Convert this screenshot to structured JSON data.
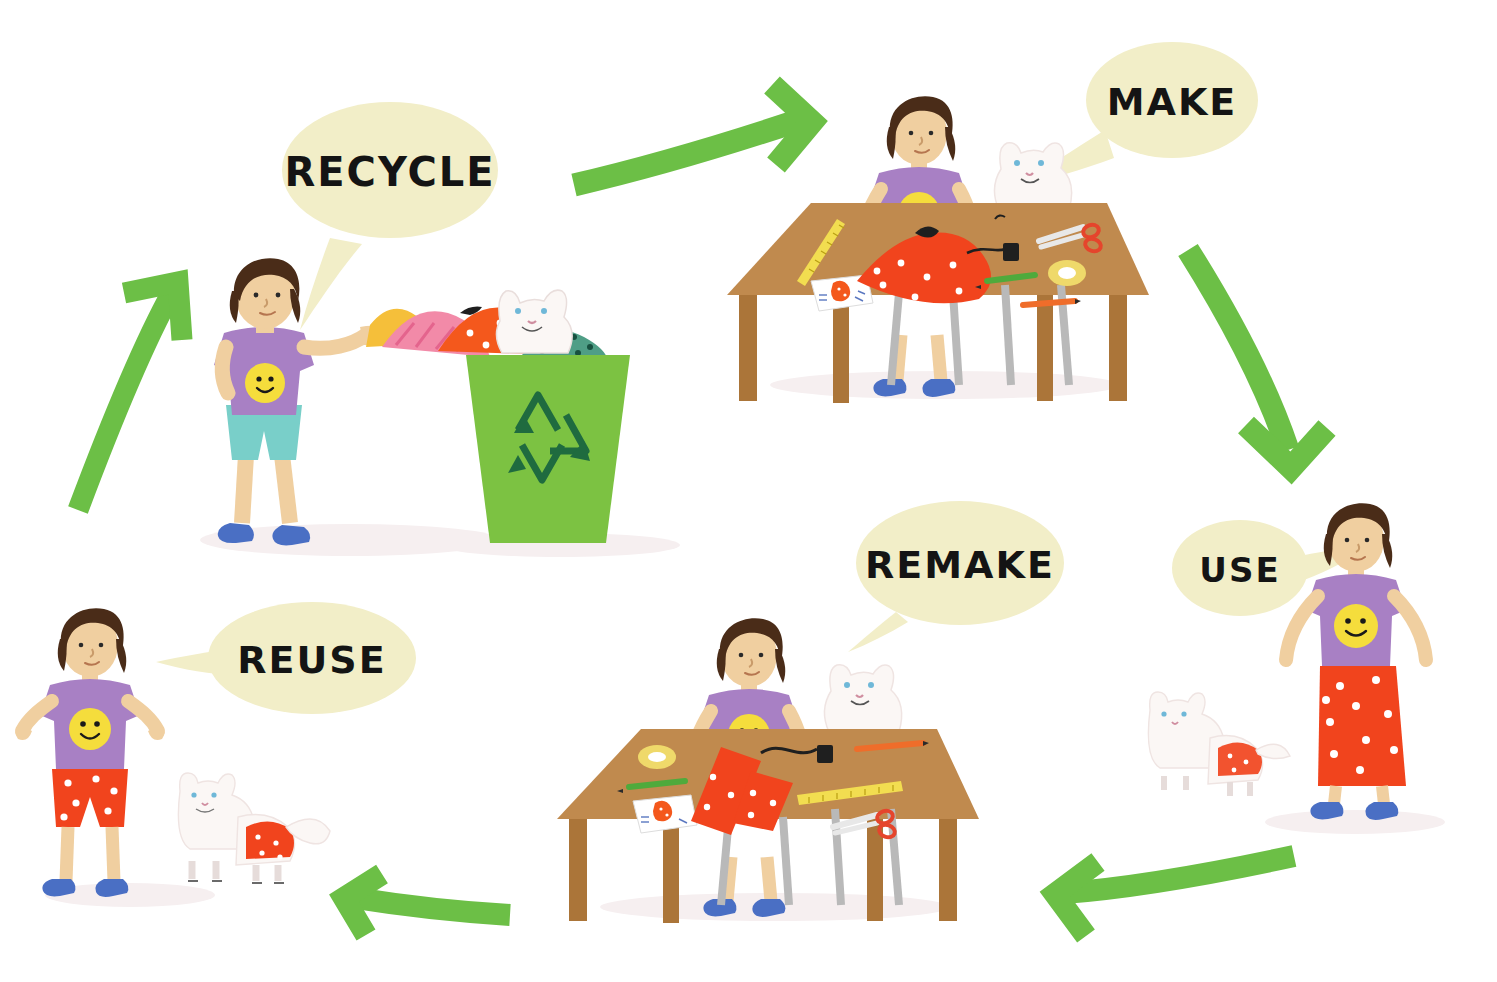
{
  "diagram": {
    "type": "cycle",
    "background_color": "#ffffff",
    "step_order": [
      "MAKE",
      "USE",
      "REMAKE",
      "REUSE",
      "RECYCLE"
    ],
    "steps": [
      {
        "id": "recycle",
        "label": "RECYCLE",
        "bubble": {
          "cx": 390,
          "cy": 170,
          "rx": 108,
          "ry": 68,
          "fill": "#f2eec8",
          "tail": "down-left",
          "font_size": 40
        },
        "scene": "Girl placing folded clothes into a green recycling bin with a white cat peeking over the top",
        "scene_box": {
          "x": 170,
          "y": 255,
          "w": 460,
          "h": 300
        }
      },
      {
        "id": "make",
        "label": "MAKE",
        "bubble": {
          "cx": 1172,
          "cy": 100,
          "rx": 86,
          "ry": 58,
          "fill": "#f2eec8",
          "tail": "down-left",
          "font_size": 38
        },
        "scene": "Girl at a wooden craft table sewing a red polka-dot skirt, white cat beside her",
        "scene_box": {
          "x": 715,
          "y": 85,
          "w": 430,
          "h": 310
        }
      },
      {
        "id": "use",
        "label": "USE",
        "bubble": {
          "cx": 1240,
          "cy": 568,
          "rx": 68,
          "ry": 48,
          "fill": "#f2eec8",
          "tail": "right",
          "font_size": 34
        },
        "scene": "Girl standing wearing the finished long red polka-dot skirt, white cat nearby",
        "scene_box": {
          "x": 1130,
          "y": 505,
          "w": 350,
          "h": 330
        }
      },
      {
        "id": "remake",
        "label": "REMAKE",
        "bubble": {
          "cx": 960,
          "cy": 563,
          "rx": 104,
          "ry": 62,
          "fill": "#f2eec8",
          "tail": "down-left",
          "font_size": 38
        },
        "scene": "Girl at the wooden table cutting the red polka-dot fabric into smaller pieces, white cat watching",
        "scene_box": {
          "x": 545,
          "y": 595,
          "w": 430,
          "h": 330
        }
      },
      {
        "id": "reuse",
        "label": "REUSE",
        "bubble": {
          "cx": 312,
          "cy": 658,
          "rx": 104,
          "ry": 56,
          "fill": "#f2eec8",
          "tail": "left",
          "font_size": 38
        },
        "scene": "Girl in red polka-dot shorts with arms open, white cat wearing matching red polka-dot shorts",
        "scene_box": {
          "x": 20,
          "y": 595,
          "w": 320,
          "h": 320
        }
      }
    ],
    "arrows": [
      {
        "id": "arrow-recycle-to-make",
        "from": "RECYCLE",
        "to": "MAKE",
        "direction": "right",
        "color": "#6cbf46"
      },
      {
        "id": "arrow-make-to-use",
        "from": "MAKE",
        "to": "USE",
        "direction": "down",
        "color": "#6cbf46"
      },
      {
        "id": "arrow-use-to-remake",
        "from": "USE",
        "to": "REMAKE",
        "direction": "left",
        "color": "#6cbf46"
      },
      {
        "id": "arrow-remake-to-reuse",
        "from": "REMAKE",
        "to": "REUSE",
        "direction": "left",
        "color": "#6cbf46"
      },
      {
        "id": "arrow-reuse-to-recycle",
        "from": "REUSE",
        "to": "RECYCLE",
        "direction": "up",
        "color": "#6cbf46"
      }
    ],
    "palette": {
      "arrow_green": "#6cbf46",
      "bin_green": "#7cc242",
      "bin_symbol_green": "#1f6b3f",
      "bubble_cream": "#f2eec8",
      "shirt_purple": "#a880c4",
      "smiley_yellow": "#f5dd3c",
      "hair_brown": "#4a2c18",
      "skin": "#f0cfa0",
      "shorts_teal": "#79cfc9",
      "fabric_red": "#f1441d",
      "table_brown": "#c08a4e",
      "table_brown_dark": "#ab7539",
      "shoe_blue": "#4a6fc4",
      "cat_white": "#fbf7f5",
      "leg_grey": "#b9b9b9",
      "pile_yellow": "#f5bf3a",
      "pile_pink": "#f28aa8",
      "pile_orange": "#f4581c",
      "pile_teal": "#4f9e86",
      "tape_yellow": "#efd96a",
      "pencil_green": "#4faa3c",
      "pencil_orange": "#ef6d2a",
      "scissors_red": "#e5452c",
      "floor_tint": "#f6eff0"
    }
  }
}
